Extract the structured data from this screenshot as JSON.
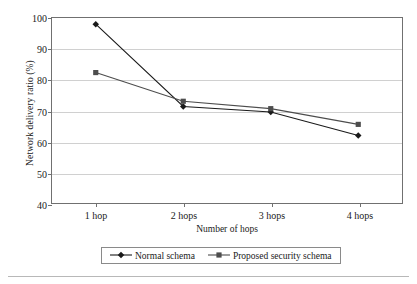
{
  "chart_data": {
    "type": "line",
    "title": "",
    "xlabel": "Number of hops",
    "ylabel": "Network delivery ratio (%)",
    "categories": [
      "1 hop",
      "2 hops",
      "3 hops",
      "4 hops"
    ],
    "ylim": [
      40,
      100
    ],
    "yticks": [
      40,
      50,
      60,
      70,
      80,
      90,
      100
    ],
    "ytick_labels": [
      "40",
      "50",
      "60",
      "70",
      "80",
      "90",
      "100"
    ],
    "grid": "horizontal",
    "legend_position": "bottom-center",
    "series": [
      {
        "name": "Normal schema",
        "marker": "diamond",
        "color": "#1a1a1a",
        "values": [
          98,
          71.3,
          69.5,
          61.9
        ]
      },
      {
        "name": "Proposed security schema",
        "marker": "square",
        "color": "#4d4d4d",
        "values": [
          82.3,
          73,
          70.6,
          65.5
        ]
      }
    ]
  },
  "legend": {
    "entries": [
      {
        "label": "Normal schema"
      },
      {
        "label": "Proposed security schema"
      }
    ]
  }
}
